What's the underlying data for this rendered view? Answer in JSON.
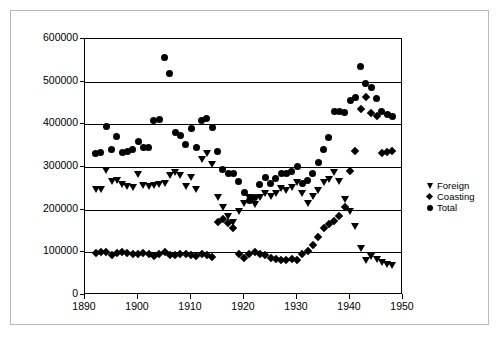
{
  "chart_data": {
    "type": "scatter",
    "title": "",
    "xlabel": "",
    "ylabel": "",
    "xlim": [
      1890,
      1950
    ],
    "ylim": [
      0,
      600000
    ],
    "xticks": [
      1890,
      1900,
      1910,
      1920,
      1930,
      1940,
      1950
    ],
    "yticks": [
      0,
      100000,
      200000,
      300000,
      400000,
      500000,
      600000
    ],
    "ytick_labels": [
      "0",
      "100000",
      "200000",
      "300000",
      "400000",
      "500000",
      "600000"
    ],
    "xtick_labels": [
      "1890",
      "1900",
      "1910",
      "1920",
      "1930",
      "1940",
      "1950"
    ],
    "grid": "horizontal",
    "legend_position": "right",
    "series": [
      {
        "name": "Foreign",
        "marker": "triangle-down",
        "color": "#000000",
        "points": [
          [
            1892,
            248000
          ],
          [
            1893,
            247000
          ],
          [
            1894,
            292000
          ],
          [
            1895,
            266000
          ],
          [
            1896,
            268000
          ],
          [
            1897,
            259000
          ],
          [
            1898,
            254000
          ],
          [
            1899,
            252000
          ],
          [
            1900,
            283000
          ],
          [
            1901,
            257000
          ],
          [
            1902,
            254000
          ],
          [
            1903,
            256000
          ],
          [
            1904,
            258000
          ],
          [
            1905,
            262000
          ],
          [
            1906,
            281000
          ],
          [
            1907,
            287000
          ],
          [
            1908,
            281000
          ],
          [
            1909,
            254000
          ],
          [
            1910,
            276000
          ],
          [
            1911,
            248000
          ],
          [
            1912,
            317000
          ],
          [
            1913,
            331000
          ],
          [
            1914,
            305000
          ],
          [
            1915,
            228000
          ],
          [
            1916,
            206000
          ],
          [
            1917,
            183000
          ],
          [
            1918,
            170000
          ],
          [
            1919,
            195000
          ],
          [
            1920,
            215000
          ],
          [
            1921,
            228000
          ],
          [
            1922,
            213000
          ],
          [
            1923,
            228000
          ],
          [
            1924,
            239000
          ],
          [
            1925,
            232000
          ],
          [
            1926,
            239000
          ],
          [
            1927,
            249000
          ],
          [
            1928,
            246000
          ],
          [
            1929,
            252000
          ],
          [
            1930,
            264000
          ],
          [
            1931,
            237000
          ],
          [
            1932,
            214000
          ],
          [
            1933,
            231000
          ],
          [
            1934,
            244000
          ],
          [
            1935,
            263000
          ],
          [
            1936,
            270000
          ],
          [
            1937,
            287000
          ],
          [
            1938,
            267000
          ],
          [
            1939,
            225000
          ],
          [
            1940,
            195000
          ],
          [
            1941,
            160000
          ],
          [
            1942,
            109000
          ],
          [
            1943,
            82000
          ],
          [
            1944,
            90000
          ],
          [
            1945,
            83000
          ],
          [
            1946,
            76000
          ],
          [
            1947,
            72000
          ],
          [
            1948,
            70000
          ]
        ]
      },
      {
        "name": "Coasting",
        "marker": "diamond",
        "color": "#000000",
        "points": [
          [
            1892,
            99000
          ],
          [
            1893,
            100000
          ],
          [
            1894,
            101000
          ],
          [
            1895,
            93000
          ],
          [
            1896,
            99000
          ],
          [
            1897,
            101000
          ],
          [
            1898,
            99000
          ],
          [
            1899,
            97000
          ],
          [
            1900,
            96000
          ],
          [
            1901,
            98000
          ],
          [
            1902,
            96000
          ],
          [
            1903,
            92000
          ],
          [
            1904,
            95000
          ],
          [
            1905,
            101000
          ],
          [
            1906,
            94000
          ],
          [
            1907,
            93000
          ],
          [
            1908,
            95000
          ],
          [
            1909,
            96000
          ],
          [
            1910,
            93000
          ],
          [
            1911,
            91000
          ],
          [
            1912,
            95000
          ],
          [
            1913,
            93000
          ],
          [
            1914,
            88000
          ],
          [
            1915,
            172000
          ],
          [
            1916,
            178000
          ],
          [
            1917,
            168000
          ],
          [
            1918,
            156000
          ],
          [
            1919,
            95000
          ],
          [
            1920,
            86000
          ],
          [
            1921,
            95000
          ],
          [
            1922,
            100000
          ],
          [
            1923,
            97000
          ],
          [
            1924,
            94000
          ],
          [
            1925,
            87000
          ],
          [
            1926,
            84000
          ],
          [
            1927,
            83000
          ],
          [
            1928,
            82000
          ],
          [
            1929,
            85000
          ],
          [
            1930,
            82000
          ],
          [
            1931,
            96000
          ],
          [
            1932,
            104000
          ],
          [
            1933,
            118000
          ],
          [
            1934,
            136000
          ],
          [
            1935,
            156000
          ],
          [
            1936,
            167000
          ],
          [
            1937,
            173000
          ],
          [
            1938,
            184000
          ],
          [
            1939,
            206000
          ],
          [
            1940,
            290000
          ],
          [
            1941,
            337000
          ],
          [
            1942,
            437000
          ],
          [
            1943,
            463000
          ],
          [
            1944,
            427000
          ],
          [
            1945,
            419000
          ],
          [
            1946,
            333000
          ],
          [
            1947,
            334000
          ],
          [
            1948,
            337000
          ]
        ]
      },
      {
        "name": "Total",
        "marker": "circle",
        "color": "#000000",
        "points": [
          [
            1892,
            331000
          ],
          [
            1893,
            334000
          ],
          [
            1894,
            394000
          ],
          [
            1895,
            341000
          ],
          [
            1896,
            371000
          ],
          [
            1897,
            333000
          ],
          [
            1898,
            337000
          ],
          [
            1899,
            340000
          ],
          [
            1900,
            359000
          ],
          [
            1901,
            345000
          ],
          [
            1902,
            345000
          ],
          [
            1903,
            409000
          ],
          [
            1904,
            411000
          ],
          [
            1905,
            556000
          ],
          [
            1906,
            519000
          ],
          [
            1907,
            380000
          ],
          [
            1908,
            374000
          ],
          [
            1909,
            352000
          ],
          [
            1910,
            390000
          ],
          [
            1911,
            345000
          ],
          [
            1912,
            408000
          ],
          [
            1913,
            413000
          ],
          [
            1914,
            392000
          ],
          [
            1915,
            337000
          ],
          [
            1916,
            293000
          ],
          [
            1917,
            285000
          ],
          [
            1918,
            285000
          ],
          [
            1919,
            265000
          ],
          [
            1920,
            240000
          ],
          [
            1921,
            221000
          ],
          [
            1922,
            229000
          ],
          [
            1923,
            258000
          ],
          [
            1924,
            276000
          ],
          [
            1925,
            261000
          ],
          [
            1926,
            274000
          ],
          [
            1927,
            284000
          ],
          [
            1928,
            285000
          ],
          [
            1929,
            290000
          ],
          [
            1930,
            302000
          ],
          [
            1931,
            262000
          ],
          [
            1932,
            269000
          ],
          [
            1933,
            285000
          ],
          [
            1934,
            310000
          ],
          [
            1935,
            341000
          ],
          [
            1936,
            368000
          ],
          [
            1937,
            430000
          ],
          [
            1938,
            431000
          ],
          [
            1939,
            427000
          ],
          [
            1940,
            456000
          ],
          [
            1941,
            464000
          ],
          [
            1942,
            535000
          ],
          [
            1943,
            496000
          ],
          [
            1944,
            487000
          ],
          [
            1945,
            460000
          ],
          [
            1946,
            430000
          ],
          [
            1947,
            424000
          ],
          [
            1948,
            419000
          ]
        ]
      }
    ],
    "legend": [
      {
        "label": "Foreign",
        "marker": "triangle-down"
      },
      {
        "label": "Coasting",
        "marker": "diamond"
      },
      {
        "label": "Total",
        "marker": "circle"
      }
    ]
  }
}
